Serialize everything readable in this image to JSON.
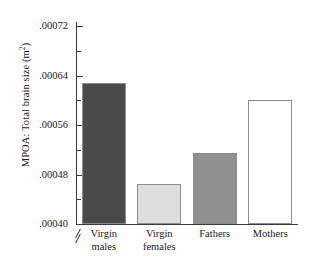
{
  "chart_data": {
    "type": "bar",
    "title": "",
    "xlabel": "",
    "ylabel": "MPOA: Total brain size (m2)",
    "ylabel_prefix": "MPOA: Total brain size (m",
    "ylabel_sup": "2",
    "ylabel_suffix": ")",
    "categories": [
      "Virgin males",
      "Virgin females",
      "Fathers",
      "Mothers"
    ],
    "category_lines": [
      [
        "Virgin",
        "males"
      ],
      [
        "Virgin",
        "females"
      ],
      [
        "Fathers",
        ""
      ],
      [
        "Mothers",
        ""
      ]
    ],
    "values": [
      0.000628,
      0.000464,
      0.000515,
      0.0006
    ],
    "ylim": [
      0.0004,
      0.00072
    ],
    "axis_break": true,
    "grid": false,
    "legend": "none",
    "ytick_labels": [
      ".00072",
      ".00064",
      ".00056",
      ".00048",
      ".00040"
    ],
    "ytick_values": [
      0.00072,
      0.00064,
      0.00056,
      0.00048,
      0.0004
    ],
    "yminor_values": [
      0.00068,
      0.0006,
      0.00052,
      0.00044
    ],
    "bar_colors": [
      "#4a4a4a",
      "#dedede",
      "#909090",
      "#ffffff"
    ],
    "bar_edge_color": "#8c8c8c",
    "axis_color": "#3a3a3a",
    "background": "#ffffff"
  }
}
